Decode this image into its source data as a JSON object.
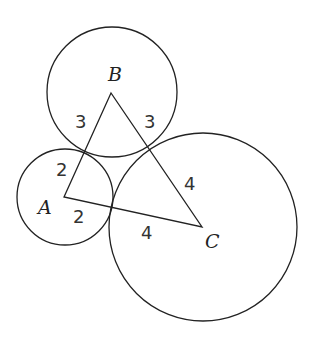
{
  "diagram": {
    "type": "three-tangent-circles-triangle",
    "stroke_color": "#222222",
    "background": "#ffffff",
    "vertices": {
      "A": {
        "label": "A",
        "x": 64,
        "y": 197
      },
      "B": {
        "label": "B",
        "x": 111,
        "y": 93
      },
      "C": {
        "label": "C",
        "x": 202,
        "y": 227
      }
    },
    "circles": [
      {
        "center": "A",
        "cx": 65,
        "cy": 197,
        "r": 48,
        "radius_label": "2"
      },
      {
        "center": "B",
        "cx": 112,
        "cy": 92,
        "r": 65,
        "radius_label": "3"
      },
      {
        "center": "C",
        "cx": 203,
        "cy": 227,
        "r": 94,
        "radius_label": "4"
      }
    ],
    "segment_labels": {
      "AB_near_B": "3",
      "BC_near_B": "3",
      "AB_near_A": "2",
      "AC_near_A": "2",
      "BC_near_C": "4",
      "AC_near_C": "4"
    }
  }
}
